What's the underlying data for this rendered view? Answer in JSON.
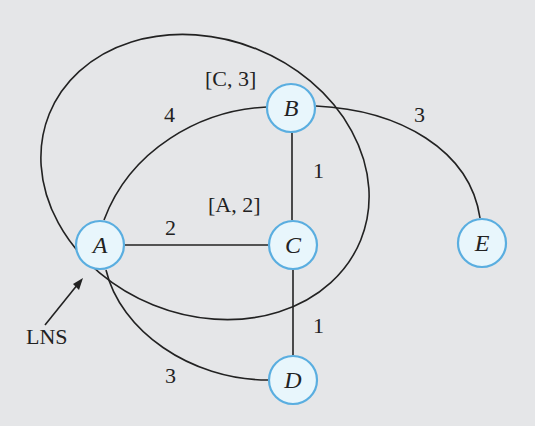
{
  "diagram": {
    "type": "network-graph",
    "nodes": [
      {
        "id": "A",
        "label": "A",
        "x": 100,
        "y": 245
      },
      {
        "id": "B",
        "label": "B",
        "x": 291,
        "y": 108
      },
      {
        "id": "C",
        "label": "C",
        "x": 293,
        "y": 245
      },
      {
        "id": "D",
        "label": "D",
        "x": 293,
        "y": 380
      },
      {
        "id": "E",
        "label": "E",
        "x": 482,
        "y": 243
      }
    ],
    "edges": [
      {
        "from": "A",
        "to": "B",
        "weight": "4"
      },
      {
        "from": "A",
        "to": "C",
        "weight": "2"
      },
      {
        "from": "A",
        "to": "D",
        "weight": "3"
      },
      {
        "from": "B",
        "to": "C",
        "weight": "1"
      },
      {
        "from": "C",
        "to": "D",
        "weight": "1"
      },
      {
        "from": "B",
        "to": "E",
        "weight": "3"
      }
    ],
    "annotations": {
      "b_label": "[C, 3]",
      "c_label": "[A, 2]",
      "lns_label": "LNS"
    },
    "colors": {
      "background": "#e5e6e8",
      "node_fill": "#e8f6fc",
      "node_stroke": "#5aaee0",
      "line": "#222222"
    }
  }
}
